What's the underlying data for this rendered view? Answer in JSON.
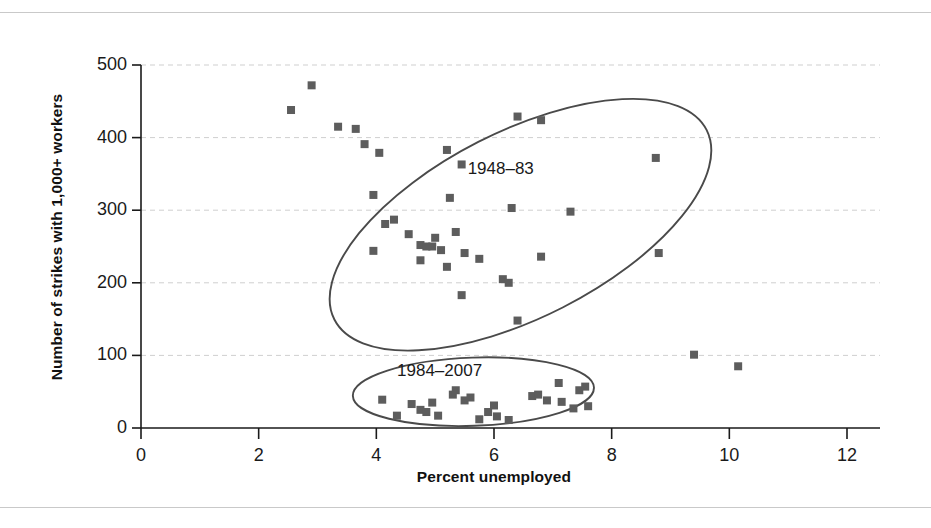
{
  "chart_data": {
    "type": "scatter",
    "title": "",
    "xlabel": "Percent unemployed",
    "ylabel": "Number of strikes with 1,000+ workers",
    "xlim": [
      0,
      12
    ],
    "ylim": [
      0,
      500
    ],
    "xticks": [
      0,
      2,
      4,
      6,
      8,
      10,
      12
    ],
    "yticks": [
      0,
      100,
      200,
      300,
      400,
      500
    ],
    "grid": "horizontal-dashed",
    "legend_position": "inline-annotations",
    "marker": "square",
    "marker_color": "#5d5d5d",
    "outline_color": "#4a4a4a",
    "gridline_color": "#cfcfcf",
    "axis_color": "#1a1a1a",
    "annotations": [
      {
        "text": "1948–83",
        "x": 6.3,
        "y": 355
      },
      {
        "text": "1984–2007",
        "x": 5.1,
        "y": 77
      }
    ],
    "groups": [
      {
        "name": "1948–83",
        "label": "1948–83",
        "ellipse": {
          "cx": 6.45,
          "cy": 280,
          "rx": 3.55,
          "ry": 128,
          "rotation_deg": -27
        },
        "points": [
          {
            "x": 2.9,
            "y": 472
          },
          {
            "x": 2.55,
            "y": 438
          },
          {
            "x": 3.35,
            "y": 415
          },
          {
            "x": 3.65,
            "y": 412
          },
          {
            "x": 3.8,
            "y": 391
          },
          {
            "x": 4.05,
            "y": 379
          },
          {
            "x": 5.2,
            "y": 383
          },
          {
            "x": 5.45,
            "y": 363
          },
          {
            "x": 6.8,
            "y": 424
          },
          {
            "x": 6.4,
            "y": 429
          },
          {
            "x": 8.75,
            "y": 372
          },
          {
            "x": 3.95,
            "y": 321
          },
          {
            "x": 5.25,
            "y": 317
          },
          {
            "x": 4.15,
            "y": 281
          },
          {
            "x": 4.3,
            "y": 287
          },
          {
            "x": 6.3,
            "y": 303
          },
          {
            "x": 7.3,
            "y": 298
          },
          {
            "x": 3.95,
            "y": 244
          },
          {
            "x": 4.55,
            "y": 267
          },
          {
            "x": 5.0,
            "y": 262
          },
          {
            "x": 5.35,
            "y": 270
          },
          {
            "x": 4.75,
            "y": 252
          },
          {
            "x": 4.85,
            "y": 250
          },
          {
            "x": 4.95,
            "y": 250
          },
          {
            "x": 5.1,
            "y": 245
          },
          {
            "x": 5.5,
            "y": 241
          },
          {
            "x": 4.75,
            "y": 231
          },
          {
            "x": 5.75,
            "y": 233
          },
          {
            "x": 6.8,
            "y": 236
          },
          {
            "x": 8.8,
            "y": 241
          },
          {
            "x": 5.2,
            "y": 222
          },
          {
            "x": 6.15,
            "y": 205
          },
          {
            "x": 6.25,
            "y": 200
          },
          {
            "x": 5.45,
            "y": 183
          },
          {
            "x": 6.4,
            "y": 148
          },
          {
            "x": 9.4,
            "y": 101
          },
          {
            "x": 10.15,
            "y": 85
          }
        ]
      },
      {
        "name": "1984–2007",
        "label": "1984–2007",
        "ellipse": {
          "cx": 5.65,
          "cy": 50,
          "rx": 2.05,
          "ry": 47,
          "rotation_deg": -2
        },
        "points": [
          {
            "x": 4.1,
            "y": 39
          },
          {
            "x": 4.35,
            "y": 17
          },
          {
            "x": 4.6,
            "y": 33
          },
          {
            "x": 4.75,
            "y": 25
          },
          {
            "x": 4.85,
            "y": 22
          },
          {
            "x": 4.95,
            "y": 35
          },
          {
            "x": 5.05,
            "y": 17
          },
          {
            "x": 5.3,
            "y": 46
          },
          {
            "x": 5.35,
            "y": 52
          },
          {
            "x": 5.5,
            "y": 38
          },
          {
            "x": 5.6,
            "y": 42
          },
          {
            "x": 5.75,
            "y": 12
          },
          {
            "x": 5.9,
            "y": 22
          },
          {
            "x": 6.0,
            "y": 31
          },
          {
            "x": 6.05,
            "y": 16
          },
          {
            "x": 6.25,
            "y": 11
          },
          {
            "x": 6.65,
            "y": 44
          },
          {
            "x": 6.75,
            "y": 46
          },
          {
            "x": 6.9,
            "y": 38
          },
          {
            "x": 7.1,
            "y": 62
          },
          {
            "x": 7.15,
            "y": 36
          },
          {
            "x": 7.35,
            "y": 27
          },
          {
            "x": 7.45,
            "y": 52
          },
          {
            "x": 7.55,
            "y": 57
          },
          {
            "x": 7.6,
            "y": 30
          }
        ]
      }
    ]
  },
  "axis": {
    "x_label": "Percent unemployed",
    "y_label": "Number of strikes with 1,000+ workers",
    "x_ticks": [
      "0",
      "2",
      "4",
      "6",
      "8",
      "10",
      "12"
    ],
    "y_ticks": [
      "0",
      "100",
      "200",
      "300",
      "400",
      "500"
    ]
  }
}
